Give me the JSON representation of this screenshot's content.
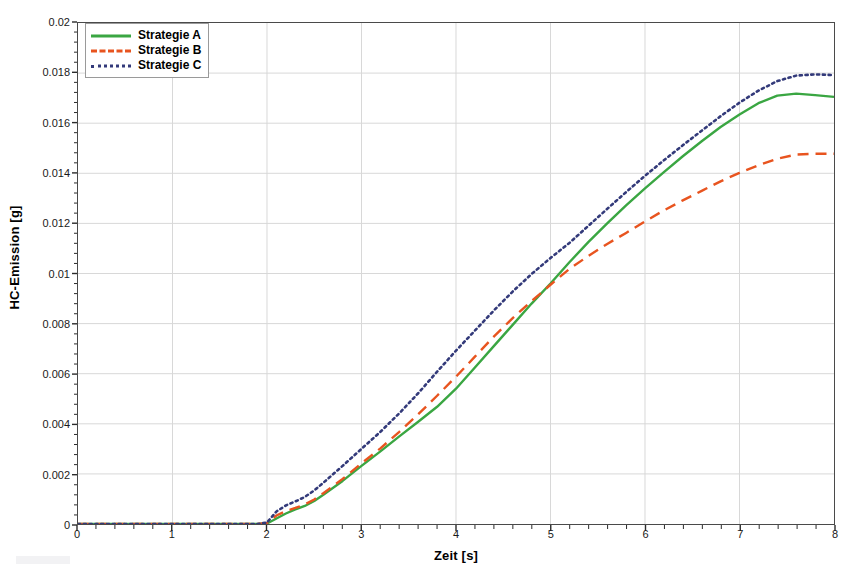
{
  "chart_data": {
    "type": "line",
    "title": "",
    "xlabel": "Zeit [s]",
    "ylabel": "HC-Emission [g]",
    "xlim": [
      0,
      8
    ],
    "ylim": [
      0,
      0.02
    ],
    "xticks": [
      "0",
      "1",
      "2",
      "3",
      "4",
      "5",
      "6",
      "7",
      "8"
    ],
    "yticks": [
      "0",
      "0.002",
      "0.004",
      "0.006",
      "0.008",
      "0.01",
      "0.012",
      "0.014",
      "0.016",
      "0.018",
      "0.02"
    ],
    "xtick_values": [
      0,
      1,
      2,
      3,
      4,
      5,
      6,
      7,
      8
    ],
    "ytick_values": [
      0,
      0.002,
      0.004,
      0.006,
      0.008,
      0.01,
      0.012,
      0.014,
      0.016,
      0.018,
      0.02
    ],
    "minor_ticks_per_interval": 5,
    "grid": true,
    "grid_color": "#d8d8d8",
    "legend_position": "top-left",
    "x": [
      0,
      0.25,
      0.5,
      0.75,
      1,
      1.25,
      1.5,
      1.75,
      1.9,
      2,
      2.1,
      2.2,
      2.3,
      2.4,
      2.5,
      2.6,
      2.8,
      3,
      3.2,
      3.4,
      3.6,
      3.8,
      4,
      4.2,
      4.4,
      4.6,
      4.8,
      5,
      5.2,
      5.4,
      5.6,
      5.8,
      6,
      6.2,
      6.4,
      6.6,
      6.8,
      7,
      7.2,
      7.4,
      7.6,
      7.8,
      8
    ],
    "series": [
      {
        "name": "Strategie A",
        "color": "#3aa642",
        "style": "solid",
        "values": [
          0,
          0,
          0,
          0,
          0,
          0,
          0,
          0,
          0,
          2e-05,
          0.00022,
          0.00042,
          0.00058,
          0.00072,
          0.00092,
          0.00118,
          0.00172,
          0.00232,
          0.0029,
          0.0035,
          0.00408,
          0.00468,
          0.0054,
          0.00625,
          0.0071,
          0.00795,
          0.0088,
          0.0096,
          0.01045,
          0.01125,
          0.012,
          0.01272,
          0.0134,
          0.01405,
          0.01468,
          0.01528,
          0.01585,
          0.01635,
          0.0168,
          0.0171,
          0.01718,
          0.01712,
          0.01705
        ]
      },
      {
        "name": "Strategie B",
        "color": "#e8541f",
        "style": "dashed",
        "values": [
          0,
          0,
          0,
          0,
          0,
          0,
          0,
          0,
          0,
          4e-05,
          0.00034,
          0.00052,
          0.00064,
          0.00078,
          0.00098,
          0.00124,
          0.0018,
          0.00242,
          0.00302,
          0.00368,
          0.00438,
          0.00512,
          0.00588,
          0.00668,
          0.00748,
          0.00822,
          0.0089,
          0.00955,
          0.01018,
          0.0107,
          0.01118,
          0.01162,
          0.01208,
          0.01252,
          0.01292,
          0.0133,
          0.01368,
          0.01402,
          0.01432,
          0.01458,
          0.01475,
          0.01478,
          0.01478
        ]
      },
      {
        "name": "Strategie C",
        "color": "#333a7a",
        "style": "dotted",
        "values": [
          0,
          0,
          0,
          0,
          0,
          0,
          0,
          0,
          0,
          6e-05,
          0.0005,
          0.00074,
          0.0009,
          0.00108,
          0.00134,
          0.00166,
          0.00232,
          0.003,
          0.00368,
          0.00442,
          0.00522,
          0.00608,
          0.00692,
          0.00772,
          0.00852,
          0.00928,
          0.00998,
          0.01062,
          0.01122,
          0.0119,
          0.01258,
          0.01325,
          0.0139,
          0.01452,
          0.01512,
          0.0157,
          0.01628,
          0.01682,
          0.0173,
          0.01768,
          0.0179,
          0.01795,
          0.01792
        ]
      }
    ],
    "legend": [
      {
        "label": "Strategie A",
        "color": "#3aa642",
        "style": "solid"
      },
      {
        "label": "Strategie B",
        "color": "#e8541f",
        "style": "dashed"
      },
      {
        "label": "Strategie C",
        "color": "#333a7a",
        "style": "dotted"
      }
    ]
  }
}
